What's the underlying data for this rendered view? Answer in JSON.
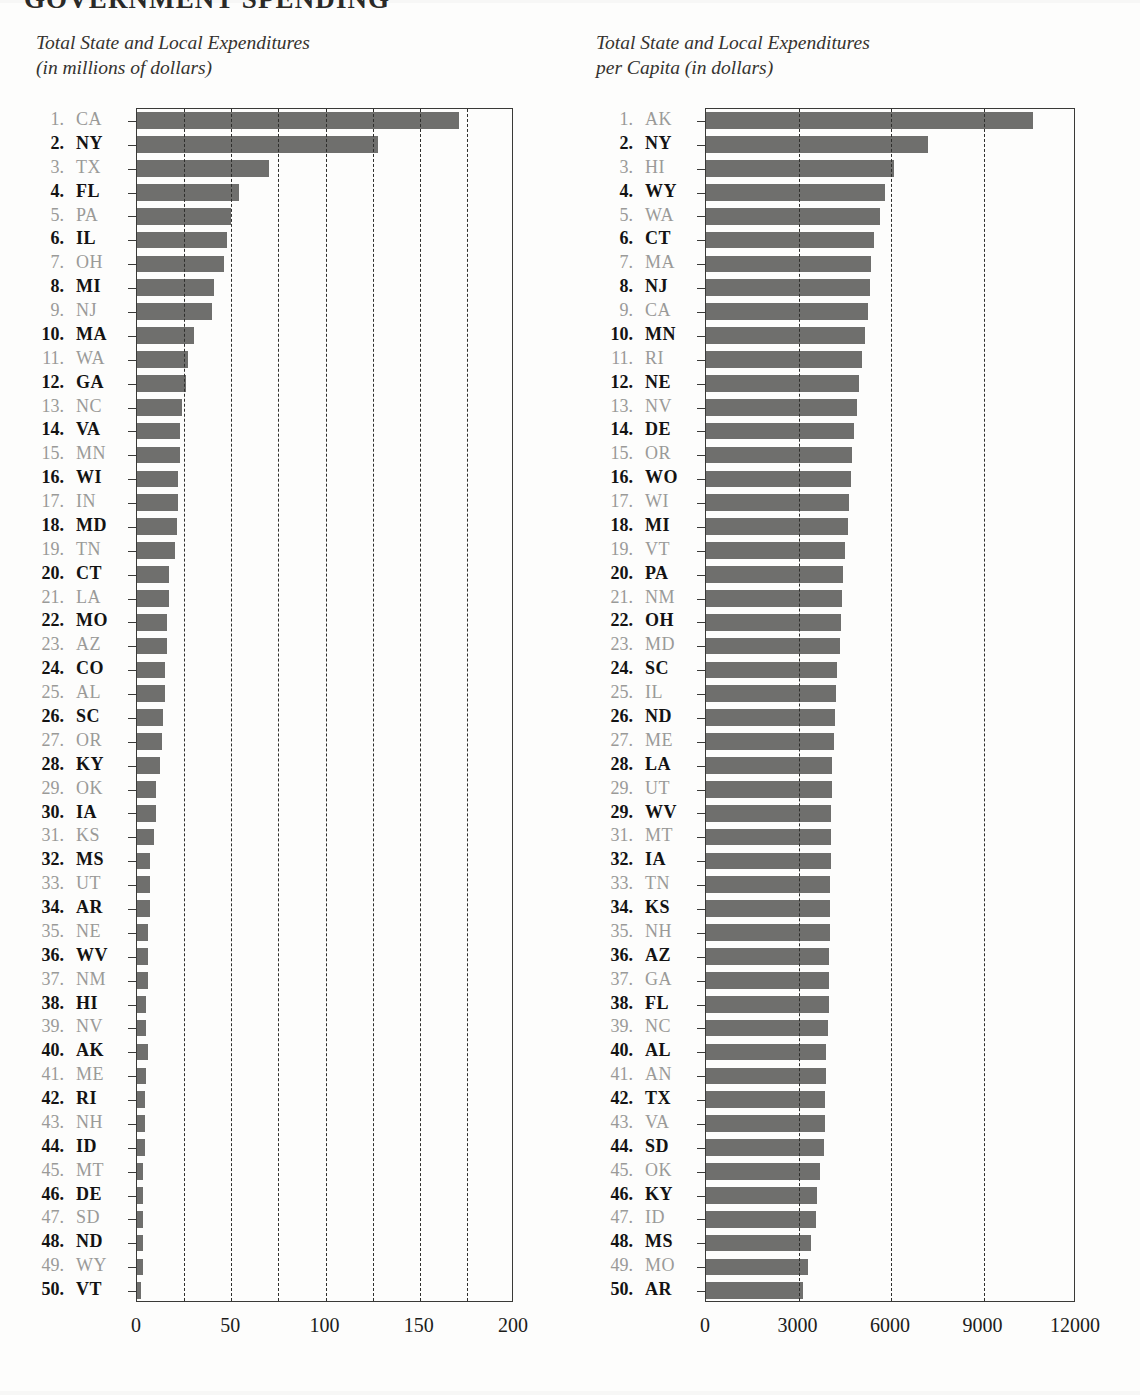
{
  "masthead": {
    "title": "GOVERNMENT SPENDING"
  },
  "panels": [
    {
      "id": "total-expenditures",
      "title_line1": "Total State and Local Expenditures",
      "title_line2": "(in millions of dollars)"
    },
    {
      "id": "per-capita-expenditures",
      "title_line1": "Total State and Local Expenditures",
      "title_line2": "per Capita (in dollars)"
    }
  ],
  "colors": {
    "bar_fill": "#6f6f6d",
    "label_dark": "#131313",
    "label_light": "#9a9a98",
    "axis": "#3a3a38",
    "gridline": "#2f2f2d",
    "page_background": "#fdfdfc"
  },
  "chart_data": [
    {
      "type": "bar",
      "orientation": "horizontal",
      "title": "Total State and Local Expenditures (in millions of dollars)",
      "xlabel": "",
      "ylabel": "",
      "xlim": [
        0,
        200
      ],
      "ylim": null,
      "grid": true,
      "gridline_interval": 25,
      "gridline_values": [
        25,
        50,
        75,
        100,
        125,
        150,
        175
      ],
      "tick_labels": [
        "0",
        "50",
        "100",
        "150",
        "200"
      ],
      "tick_values": [
        0,
        50,
        100,
        150,
        200
      ],
      "legend": null,
      "categories": [
        "CA",
        "NY",
        "TX",
        "FL",
        "PA",
        "IL",
        "OH",
        "MI",
        "NJ",
        "MA",
        "WA",
        "GA",
        "NC",
        "VA",
        "MN",
        "WI",
        "IN",
        "MD",
        "TN",
        "CT",
        "LA",
        "MO",
        "AZ",
        "CO",
        "AL",
        "SC",
        "OR",
        "KY",
        "OK",
        "IA",
        "KS",
        "MS",
        "UT",
        "AR",
        "NE",
        "WV",
        "NM",
        "HI",
        "NV",
        "AK",
        "ME",
        "RI",
        "NH",
        "ID",
        "MT",
        "DE",
        "SD",
        "ND",
        "WY",
        "VT"
      ],
      "ranks": [
        1,
        2,
        3,
        4,
        5,
        6,
        7,
        8,
        9,
        10,
        11,
        12,
        13,
        14,
        15,
        16,
        17,
        18,
        19,
        20,
        21,
        22,
        23,
        24,
        25,
        26,
        27,
        28,
        29,
        30,
        31,
        32,
        33,
        34,
        35,
        36,
        37,
        38,
        39,
        40,
        41,
        42,
        43,
        44,
        45,
        46,
        47,
        48,
        49,
        50
      ],
      "values": [
        171,
        128,
        70,
        54,
        50,
        48,
        46,
        41,
        40,
        30,
        27,
        26,
        24,
        23,
        23,
        22,
        22,
        21,
        20,
        17,
        17,
        16,
        16,
        15,
        15,
        14,
        13,
        12,
        10,
        10,
        9,
        7,
        7,
        7,
        6,
        6,
        6,
        5,
        5,
        6,
        5,
        4,
        4,
        4,
        3,
        3,
        3,
        3,
        3,
        2
      ]
    },
    {
      "type": "bar",
      "orientation": "horizontal",
      "title": "Total State and Local Expenditures per Capita (in dollars)",
      "xlabel": "",
      "ylabel": "",
      "xlim": [
        0,
        12000
      ],
      "ylim": null,
      "grid": true,
      "gridline_interval": 3000,
      "gridline_values": [
        3000,
        6000,
        9000
      ],
      "tick_labels": [
        "0",
        "3000",
        "6000",
        "9000",
        "12000"
      ],
      "tick_values": [
        0,
        3000,
        6000,
        9000,
        12000
      ],
      "legend": null,
      "categories": [
        "AK",
        "NY",
        "HI",
        "WY",
        "WA",
        "CT",
        "MA",
        "NJ",
        "CA",
        "MN",
        "RI",
        "NE",
        "NV",
        "DE",
        "OR",
        "WO",
        "WI",
        "MI",
        "VT",
        "PA",
        "NM",
        "OH",
        "MD",
        "SC",
        "IL",
        "ND",
        "ME",
        "LA",
        "UT",
        "WV",
        "MT",
        "IA",
        "TN",
        "KS",
        "NH",
        "AZ",
        "GA",
        "FL",
        "NC",
        "AL",
        "AN",
        "TX",
        "VA",
        "SD",
        "OK",
        "KY",
        "ID",
        "MS",
        "MO",
        "AR"
      ],
      "ranks": [
        1,
        2,
        3,
        4,
        5,
        6,
        7,
        8,
        9,
        10,
        11,
        12,
        13,
        14,
        15,
        16,
        17,
        18,
        19,
        20,
        21,
        22,
        23,
        24,
        25,
        26,
        27,
        28,
        29,
        29,
        31,
        32,
        33,
        34,
        35,
        36,
        37,
        38,
        39,
        40,
        41,
        42,
        43,
        44,
        45,
        46,
        47,
        48,
        49,
        50
      ],
      "values": [
        10600,
        7200,
        6100,
        5800,
        5650,
        5450,
        5350,
        5330,
        5250,
        5150,
        5050,
        4950,
        4900,
        4800,
        4750,
        4700,
        4650,
        4600,
        4500,
        4450,
        4400,
        4380,
        4340,
        4250,
        4200,
        4180,
        4150,
        4100,
        4080,
        4060,
        4050,
        4040,
        4030,
        4020,
        4010,
        4000,
        3990,
        3980,
        3960,
        3900,
        3880,
        3870,
        3860,
        3830,
        3700,
        3600,
        3560,
        3420,
        3320,
        3150
      ]
    }
  ]
}
